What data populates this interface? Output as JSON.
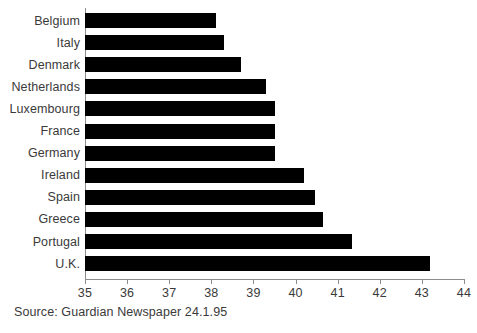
{
  "chart_data": {
    "type": "bar",
    "orientation": "horizontal",
    "title": "",
    "subtitle": "",
    "xlabel": "",
    "ylabel": "",
    "xlim": [
      35,
      44
    ],
    "ylim": null,
    "grid": false,
    "legend": null,
    "xticks": [
      35,
      36,
      37,
      38,
      39,
      40,
      41,
      42,
      43,
      44
    ],
    "xtick_labels": [
      "35",
      "36",
      "37",
      "38",
      "39",
      "40",
      "41",
      "42",
      "43",
      "44"
    ],
    "categories": [
      "Belgium",
      "Italy",
      "Denmark",
      "Netherlands",
      "Luxembourg",
      "France",
      "Germany",
      "Ireland",
      "Spain",
      "Greece",
      "Portugal",
      "U.K."
    ],
    "values": [
      38.1,
      38.3,
      38.7,
      39.3,
      39.5,
      39.5,
      39.5,
      40.2,
      40.45,
      40.65,
      41.35,
      43.2
    ],
    "series": [
      {
        "name": "Hours worked",
        "values": [
          38.1,
          38.3,
          38.7,
          39.3,
          39.5,
          39.5,
          39.5,
          40.2,
          40.45,
          40.65,
          41.35,
          43.2
        ]
      }
    ],
    "bar_color": "#000000",
    "axis_color": "#8d8d8d",
    "annotations": [
      "Source: Guardian Newspaper 24.1.95"
    ]
  },
  "source": {
    "text": "Source: Guardian Newspaper 24.1.95"
  }
}
